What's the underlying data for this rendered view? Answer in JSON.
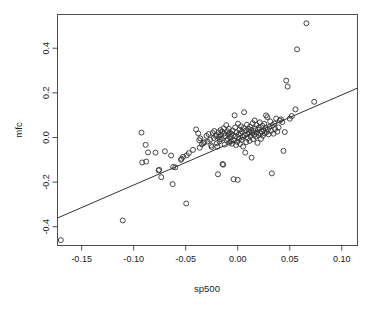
{
  "chart_data": {
    "type": "scatter",
    "title": "",
    "xlabel": "sp500",
    "ylabel": "mfc",
    "xlim": [
      -0.1732,
      0.1151
    ],
    "ylim": [
      -0.4842,
      0.5512
    ],
    "xticks": [
      -0.15,
      -0.1,
      -0.05,
      0.0,
      0.05,
      0.1
    ],
    "xticklabels": [
      "-0.15",
      "-0.10",
      "-0.05",
      "0.00",
      "0.05",
      "0.10"
    ],
    "yticks": [
      -0.4,
      -0.2,
      0.0,
      0.2,
      0.4
    ],
    "yticklabels": [
      "-0.4",
      "-0.2",
      "0.0",
      "0.2",
      "0.4"
    ],
    "grid": false,
    "legend": null,
    "point_marker": "open-circle",
    "point_color": "#333333",
    "line_color": "#333333",
    "regression_line": {
      "x_start": -0.1732,
      "y_start": -0.361,
      "x_end": 0.1151,
      "y_end": 0.2213,
      "slope": 2.019,
      "intercept": -0.0114
    },
    "x": [
      -0.17,
      -0.1105,
      -0.0925,
      -0.0918,
      -0.0885,
      -0.088,
      -0.0862,
      -0.079,
      -0.076,
      -0.0755,
      -0.0735,
      -0.07,
      -0.064,
      -0.0625,
      -0.062,
      -0.06,
      -0.0545,
      -0.054,
      -0.0525,
      -0.0495,
      -0.049,
      -0.047,
      -0.043,
      -0.04,
      -0.038,
      -0.037,
      -0.0365,
      -0.036,
      -0.0345,
      -0.033,
      -0.032,
      -0.03,
      -0.029,
      -0.028,
      -0.0265,
      -0.0255,
      -0.025,
      -0.024,
      -0.023,
      -0.0225,
      -0.0215,
      -0.0205,
      -0.02,
      -0.0195,
      -0.019,
      -0.0185,
      -0.018,
      -0.0175,
      -0.017,
      -0.0165,
      -0.016,
      -0.0155,
      -0.015,
      -0.0145,
      -0.014,
      -0.0135,
      -0.013,
      -0.0125,
      -0.012,
      -0.011,
      -0.0105,
      -0.01,
      -0.0095,
      -0.009,
      -0.0085,
      -0.008,
      -0.0075,
      -0.007,
      -0.0065,
      -0.006,
      -0.0055,
      -0.005,
      -0.0045,
      -0.004,
      -0.0035,
      -0.003,
      -0.0025,
      -0.002,
      -0.0015,
      -0.001,
      -0.0005,
      0.0,
      0.0003,
      0.0008,
      0.0012,
      0.0018,
      0.0022,
      0.0028,
      0.0032,
      0.0038,
      0.0042,
      0.0048,
      0.0052,
      0.0058,
      0.0062,
      0.0068,
      0.0072,
      0.0078,
      0.0082,
      0.0088,
      0.0092,
      0.0098,
      0.0103,
      0.0108,
      0.0113,
      0.0118,
      0.0123,
      0.0128,
      0.0133,
      0.0138,
      0.0143,
      0.0148,
      0.0153,
      0.0158,
      0.0163,
      0.0168,
      0.0175,
      0.018,
      0.0185,
      0.019,
      0.0195,
      0.02,
      0.0205,
      0.0212,
      0.0218,
      0.0224,
      0.023,
      0.0236,
      0.0242,
      0.0248,
      0.0254,
      0.026,
      0.0266,
      0.0272,
      0.0278,
      0.0284,
      0.029,
      0.0296,
      0.0305,
      0.0312,
      0.032,
      0.0328,
      0.0336,
      0.0344,
      0.0352,
      0.036,
      0.037,
      0.038,
      0.0392,
      0.0404,
      0.0416,
      0.0428,
      0.044,
      0.0452,
      0.0466,
      0.048,
      0.05,
      0.052,
      0.0555,
      0.057,
      0.066,
      0.0735,
      0.0745,
      0.084,
      0.088,
      0.094,
      0.106
    ],
    "y": [
      -0.46,
      -0.372,
      0.022,
      -0.112,
      -0.033,
      -0.108,
      -0.067,
      -0.068,
      -0.148,
      -0.145,
      -0.178,
      -0.062,
      -0.081,
      -0.209,
      -0.132,
      -0.134,
      -0.1,
      -0.0955,
      -0.087,
      -0.296,
      -0.08,
      -0.07,
      -0.0555,
      0.036,
      0.0185,
      -0.012,
      -0.046,
      -0.004,
      -0.0305,
      -0.0255,
      -0.0215,
      0.007,
      -0.018,
      0.0155,
      -0.01,
      -0.036,
      -0.043,
      0.02,
      -0.002,
      0.029,
      0.0075,
      0.0105,
      -0.0255,
      -0.041,
      -0.165,
      0.023,
      0.003,
      -0.0175,
      -0.009,
      0.033,
      0.012,
      -0.006,
      0.026,
      -0.119,
      -0.122,
      0.041,
      0.018,
      -0.032,
      0.006,
      0.055,
      -0.014,
      0.028,
      -0.007,
      0.013,
      0.039,
      -0.023,
      0.021,
      0.0025,
      -0.0165,
      0.016,
      -0.028,
      0.031,
      0.009,
      -0.187,
      -0.013,
      0.0995,
      0.045,
      0.005,
      -0.034,
      0.023,
      -0.0195,
      -0.19,
      0.062,
      0.013,
      -0.0055,
      0.035,
      -0.029,
      0.018,
      0.05,
      -0.0105,
      0.0265,
      0.002,
      -0.041,
      0.042,
      0.113,
      0.0095,
      -0.068,
      0.031,
      -0.021,
      0.057,
      0.015,
      -0.003,
      0.039,
      0.024,
      -0.015,
      0.048,
      0.007,
      0.034,
      -0.0905,
      0.02,
      0.064,
      -0.008,
      0.029,
      0.013,
      0.076,
      0.04,
      0.004,
      0.056,
      0.022,
      -0.024,
      0.0355,
      0.011,
      0.045,
      0.068,
      0.018,
      -0.006,
      0.027,
      0.052,
      0.008,
      0.032,
      0.061,
      0.019,
      0.043,
      0.099,
      0.024,
      0.091,
      0.036,
      0.014,
      0.048,
      0.072,
      0.03,
      -0.161,
      0.055,
      0.017,
      0.062,
      0.038,
      0.085,
      0.026,
      0.045,
      0.076,
      0.081,
      0.069,
      -0.06,
      0.0245,
      0.255,
      0.228,
      0.084,
      0.096,
      0.126,
      0.395,
      0.512,
      0.16
    ]
  },
  "labels": {
    "xlabel": "sp500",
    "ylabel": "mfc"
  }
}
